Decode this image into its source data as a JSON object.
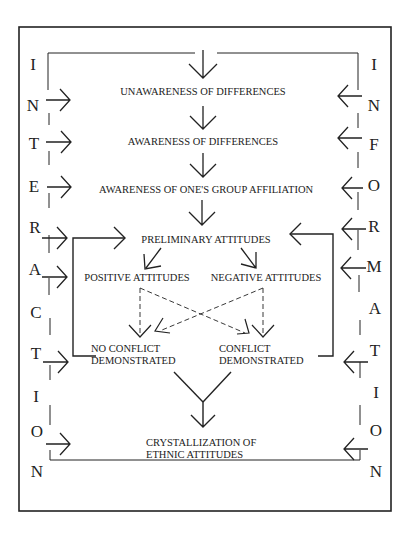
{
  "diagram": {
    "left_label": "INTERACTION",
    "right_label": "INFORMATION",
    "left_letters": [
      "I",
      "N",
      "T",
      "E",
      "R",
      "A",
      "C",
      "T",
      "I",
      "O",
      "N"
    ],
    "right_letters": [
      "I",
      "N",
      "F",
      "O",
      "R",
      "M",
      "A",
      "T",
      "I",
      "O",
      "N"
    ],
    "nodes": {
      "unawareness": "UNAWARENESS OF DIFFERENCES",
      "awareness": "AWARENESS OF DIFFERENCES",
      "group_affiliation": "AWARENESS OF ONE'S GROUP AFFILIATION",
      "preliminary": "PRELIMINARY ATTITUDES",
      "positive": "POSITIVE ATTITUDES",
      "negative": "NEGATIVE ATTITUDES",
      "no_conflict_1": "NO CONFLICT",
      "no_conflict_2": "DEMONSTRATED",
      "conflict_1": "CONFLICT",
      "conflict_2": "DEMONSTRATED",
      "crystallization_1": "CRYSTALLIZATION OF",
      "crystallization_2": "ETHNIC ATTITUDES"
    }
  }
}
